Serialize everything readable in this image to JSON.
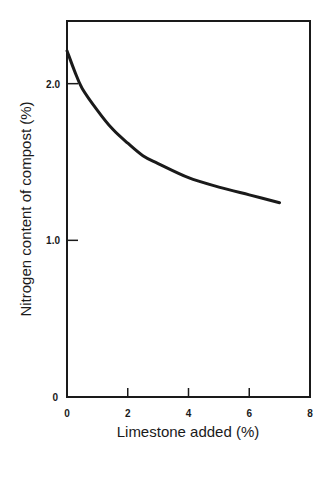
{
  "chart_data": {
    "type": "line",
    "title": "",
    "xlabel": "Limestone added (%)",
    "ylabel": "Nitrogen content of compost (%)",
    "xlim": [
      0,
      8
    ],
    "ylim": [
      0,
      2.4
    ],
    "xticks": [
      0,
      2,
      4,
      6,
      8
    ],
    "xtick_labels": [
      "0",
      "2",
      "4",
      "6",
      "8"
    ],
    "yticks": [
      0,
      1.0,
      2.0
    ],
    "ytick_labels": [
      "0",
      "1.0",
      "2.0"
    ],
    "grid": false,
    "legend": null,
    "series": [
      {
        "name": "Nitrogen content",
        "x": [
          0,
          0.25,
          0.5,
          1,
          1.5,
          2,
          2.5,
          3,
          4,
          5,
          6,
          7
        ],
        "y": [
          2.21,
          2.08,
          1.97,
          1.83,
          1.71,
          1.62,
          1.54,
          1.49,
          1.4,
          1.34,
          1.29,
          1.24
        ]
      }
    ]
  },
  "labels": {
    "x_axis_title": "Limestone added (%)",
    "y_axis_title": "Nitrogen content of compost (%)",
    "origin_y": "0",
    "origin_x": "0"
  }
}
